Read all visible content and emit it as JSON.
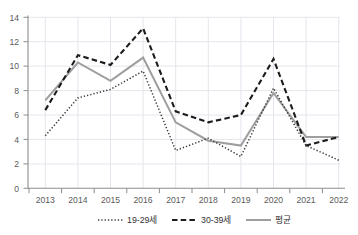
{
  "chart_data": {
    "type": "line",
    "title": "",
    "xlabel": "",
    "ylabel": "",
    "ylim": [
      0,
      14
    ],
    "yticks": [
      0,
      2,
      4,
      6,
      8,
      10,
      12,
      14
    ],
    "grid": true,
    "legend_position": "bottom",
    "categories": [
      "2013",
      "2014",
      "2015",
      "2016",
      "2017",
      "2018",
      "2019",
      "2020",
      "2021",
      "2022"
    ],
    "series": [
      {
        "name": "19-29세",
        "style": "dotted",
        "color": "#3a3a3a",
        "values": [
          4.3,
          7.4,
          8.1,
          9.6,
          3.1,
          4.1,
          2.6,
          8.2,
          3.5,
          2.3
        ]
      },
      {
        "name": "30-39세",
        "style": "dashed",
        "color": "#1c1c1c",
        "values": [
          6.4,
          10.9,
          10.1,
          13.1,
          6.3,
          5.4,
          6.0,
          10.6,
          3.5,
          4.2
        ]
      },
      {
        "name": "평균",
        "style": "solid",
        "color": "#9e9e9e",
        "values": [
          7.2,
          10.3,
          8.8,
          10.7,
          5.4,
          3.9,
          3.5,
          7.8,
          4.2,
          4.2
        ]
      }
    ]
  },
  "axes": {
    "y_tick_labels": [
      "0",
      "2",
      "4",
      "6",
      "8",
      "10",
      "12",
      "14"
    ],
    "x_tick_labels": [
      "2013",
      "2014",
      "2015",
      "2016",
      "2017",
      "2018",
      "2019",
      "2020",
      "2021",
      "2022"
    ]
  },
  "legend": {
    "entries": [
      {
        "label": "19-29세",
        "marker": "dotted-line-swatch"
      },
      {
        "label": "30-39세",
        "marker": "dashed-line-swatch"
      },
      {
        "label": "평균",
        "marker": "solid-line-swatch"
      }
    ]
  },
  "colors": {
    "grid": "#e3e6ec",
    "axis": "#8d8d8d",
    "average_series": "#9e9e9e",
    "age_30s_series": "#1c1c1c",
    "age_20s_series": "#3a3a3a",
    "background": "#ffffff"
  }
}
